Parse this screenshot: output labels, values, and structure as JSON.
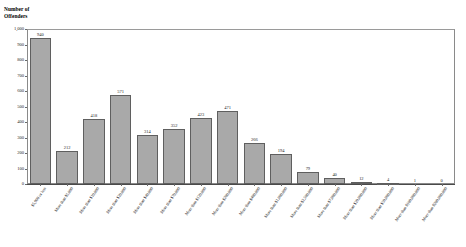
{
  "chart_data": {
    "type": "bar",
    "title": "",
    "ylabel": "Number of\nOffenders",
    "xlabel": "",
    "ylim": [
      0,
      1000
    ],
    "ytick_labels": [
      "1,000",
      "900",
      "800",
      "700",
      "600",
      "500",
      "400",
      "300",
      "200",
      "100",
      "0"
    ],
    "ytick_values": [
      1000,
      900,
      800,
      700,
      600,
      500,
      400,
      300,
      200,
      100,
      0
    ],
    "grid": false,
    "legend": null,
    "bar_color": "#a9a9a9",
    "bar_edge_color": "#5f5f5f",
    "categories": [
      "$5,000 or less",
      "More than $5,000",
      "More than $10,000",
      "More than $20,000",
      "More than $40,000",
      "More than $70,000",
      "More than $120,000",
      "More than $200,000",
      "More than $400,000",
      "More than $1,000,000",
      "More than $2,500,000",
      "More than $7,000,000",
      "More than $20,000,000",
      "More than $50,000,000",
      "More than $100,000,000",
      "More than $200,000,000"
    ],
    "values": [
      940,
      212,
      418,
      571,
      314,
      352,
      423,
      471,
      266,
      194,
      79,
      40,
      12,
      4,
      1,
      0
    ],
    "value_labels": [
      "940",
      "212",
      "418",
      "571",
      "314",
      "352",
      "423",
      "471",
      "266",
      "194",
      "79",
      "40",
      "12",
      "4",
      "1",
      "0"
    ]
  }
}
